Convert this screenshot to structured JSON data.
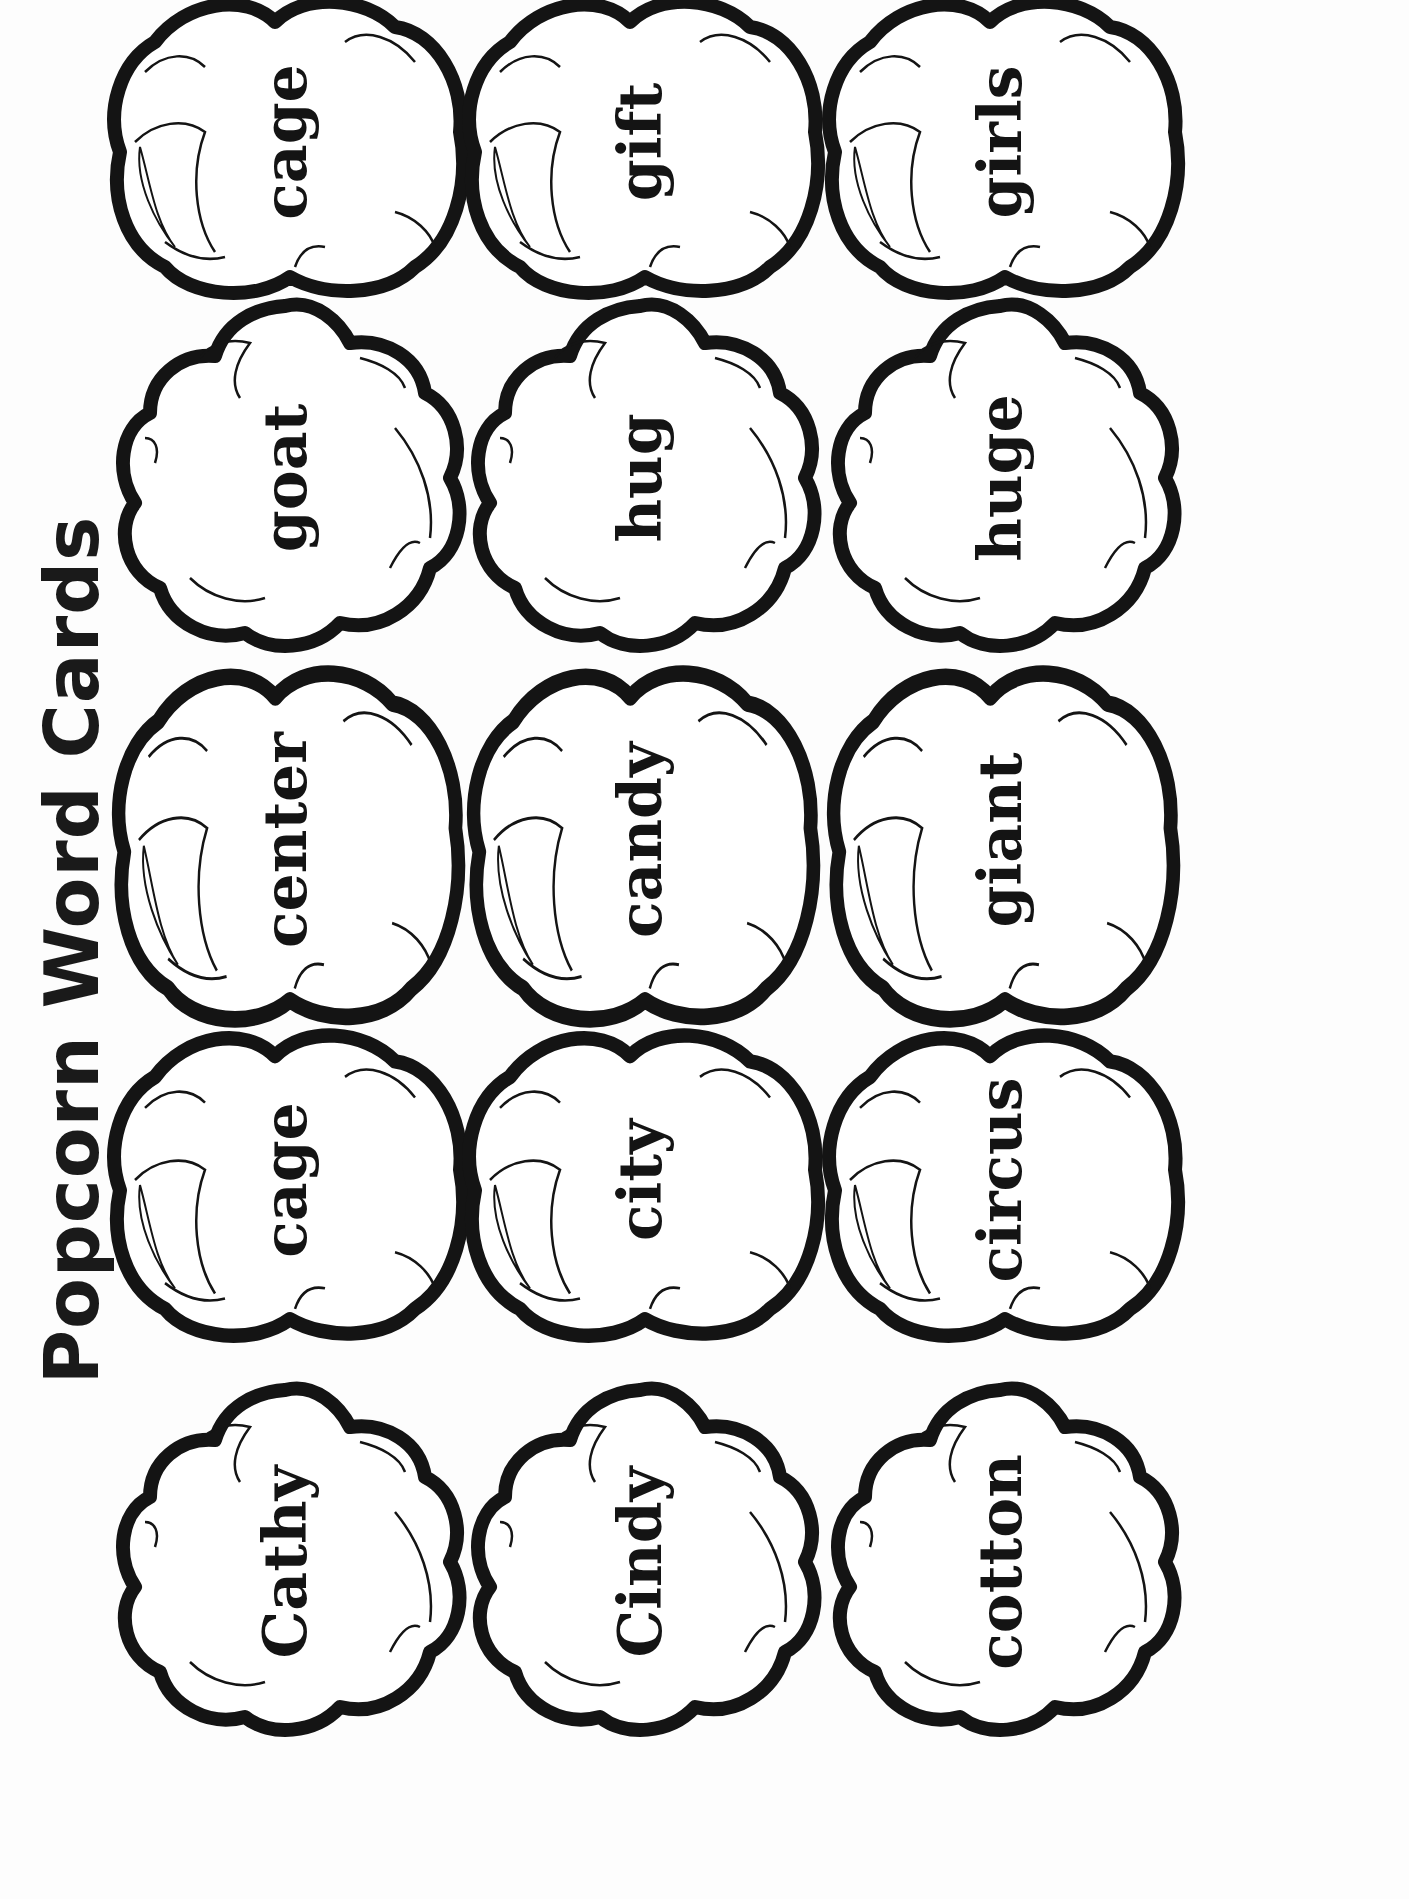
{
  "title": "Popcorn Word Cards",
  "colors": {
    "ink": "#141414",
    "paper": "#fdfdfd"
  },
  "cards": {
    "row1": [
      {
        "word": "cage"
      },
      {
        "word": "gift"
      },
      {
        "word": "girls"
      }
    ],
    "row2": [
      {
        "word": "goat"
      },
      {
        "word": "hug"
      },
      {
        "word": "huge"
      }
    ],
    "row3": [
      {
        "word": "center"
      },
      {
        "word": "candy"
      },
      {
        "word": "giant"
      }
    ],
    "row4": [
      {
        "word": "cage"
      },
      {
        "word": "city"
      },
      {
        "word": "circus"
      }
    ],
    "row5": [
      {
        "word": "Cathy"
      },
      {
        "word": "Cindy"
      },
      {
        "word": "cotton"
      }
    ]
  },
  "icons": {
    "card_shape": "popcorn-outline"
  }
}
